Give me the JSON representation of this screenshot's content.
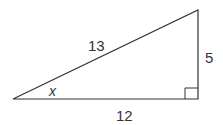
{
  "diagram": {
    "type": "right-triangle",
    "hypotenuse_label": "13",
    "vertical_leg_label": "5",
    "horizontal_leg_label": "12",
    "angle_label": "x",
    "line_color": "#333333",
    "label_color": "#333333"
  }
}
